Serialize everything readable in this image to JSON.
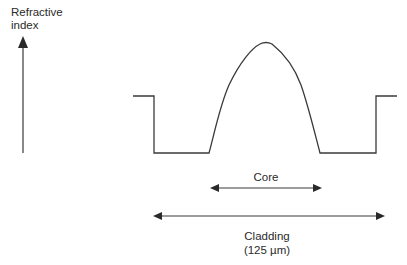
{
  "axis": {
    "y_label_line1": "Refractive",
    "y_label_line2": "index"
  },
  "labels": {
    "core": "Core",
    "cladding": "Cladding",
    "cladding_size": "(125 µm)"
  },
  "colors": {
    "line": "#3a3a3a",
    "text": "#2a2a2a",
    "background": "#ffffff"
  }
}
